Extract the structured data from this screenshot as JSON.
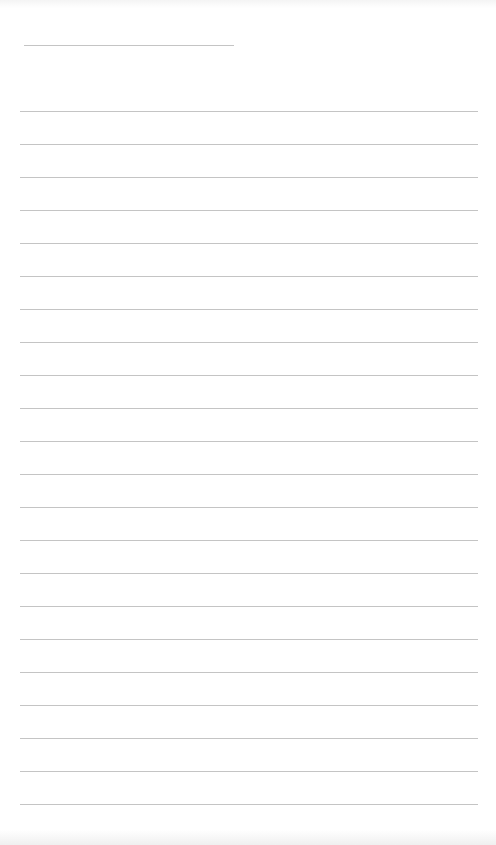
{
  "page": {
    "type": "blank-lined-sheet",
    "background": "#ffffff",
    "rule_color": "#c4c4c4"
  },
  "header_line": {
    "x": 24,
    "y": 45,
    "width": 210,
    "text": ""
  },
  "ruled_lines": {
    "start_y": 111,
    "spacing": 33,
    "count": 22,
    "x": 20,
    "width": 458,
    "texts": []
  }
}
